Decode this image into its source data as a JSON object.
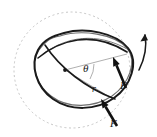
{
  "figure": {
    "type": "mechanics-diagram",
    "width": 157,
    "height": 137,
    "background_color": "#ffffff"
  },
  "colors": {
    "reference_circle": "#b8b8b8",
    "ring_outline": "#1a1a1a",
    "ring_secondary": "#6e6e6e",
    "radius_line": "#9a9a9a",
    "force_arrow": "#111111",
    "rotation_arrow": "#1a1a1a",
    "label_text": "#1a1a1a",
    "center_dot": "#1a1a1a"
  },
  "reference_circle": {
    "name": "undeformed-reference-circle",
    "center_x": 72,
    "center_y": 70,
    "radius": 58,
    "stroke_dasharray": "2 2.6",
    "stroke_width": 0.8
  },
  "center_point": {
    "name": "center-dot",
    "x": 65,
    "y": 70,
    "radius": 1.9
  },
  "labels": [
    {
      "id": "theta",
      "name": "angle-theta-label",
      "text": "θ",
      "x": 83,
      "y": 63,
      "class": "label-theta"
    },
    {
      "id": "r",
      "name": "radius-r-label",
      "text": "r",
      "x": 92,
      "y": 84,
      "class": "label-r"
    },
    {
      "id": "F-right",
      "name": "force-label-right",
      "text": "F",
      "x": 120,
      "y": 80,
      "class": "label-f"
    },
    {
      "id": "F-bottom",
      "name": "force-label-bottom",
      "text": "F",
      "x": 110,
      "y": 118,
      "class": "label-f"
    }
  ],
  "force_vectors": [
    {
      "id": "F-right",
      "name": "force-arrow-right",
      "tail_x": 126,
      "tail_y": 88,
      "head_x": 113,
      "head_y": 57,
      "shaft_width": 2.6,
      "head_length": 9,
      "head_width": 7
    },
    {
      "id": "F-bottom",
      "name": "force-arrow-bottom",
      "tail_x": 117,
      "tail_y": 126,
      "head_x": 101,
      "head_y": 99,
      "shaft_width": 2.6,
      "head_length": 9,
      "head_width": 7
    }
  ],
  "rotation_arrow": {
    "name": "rotation-direction-arrow",
    "description": "Curved arrow on the right indicating direction of rotation",
    "path": "M 139 70 C 145 58 147 46 145 35",
    "head_x": 145,
    "head_y": 34,
    "stroke_width": 1.6
  },
  "radius_lines": [
    {
      "name": "radius-line-upper",
      "from_x": 65,
      "from_y": 70,
      "to_x": 127,
      "to_y": 54
    },
    {
      "name": "radius-line-lower",
      "from_x": 65,
      "from_y": 70,
      "to_x": 113,
      "to_y": 99
    }
  ],
  "angle_arc": {
    "name": "angle-arc-theta",
    "path": "M 94 64 A 30 30 0 0 1 90 79",
    "stroke_width": 0.8
  },
  "deformed_ring": {
    "name": "deformed-ring-primary",
    "path": "M 64 33 C 86 27 116 33 128 48 C 139 62 131 86 114 98 C 96 111 70 111 53 99 C 36 87 30 65 38 50 C 44 39 53 36 64 33 Z",
    "stroke_width": 2.0
  },
  "deformed_ring_secondary": {
    "name": "deformed-ring-secondary",
    "path": "M 60 36 C 82 29 114 34 127 48 C 138 61 129 84 112 96 C 94 108 68 109 51 96 C 35 84 30 63 39 50 C 45 41 50 38 60 36 Z",
    "stroke_width": 1.2
  },
  "crossing_curves": [
    {
      "name": "crossing-curve-upper",
      "path": "M 38 58 C 60 40 92 30 127 52",
      "stroke_width": 1.6
    },
    {
      "name": "crossing-curve-lower",
      "path": "M 45 45 C 60 68 86 88 115 99",
      "stroke_width": 1.6
    },
    {
      "name": "crossing-curve-light-upper",
      "path": "M 43 54 C 66 37 96 31 129 50",
      "stroke_width": 0.9
    }
  ]
}
